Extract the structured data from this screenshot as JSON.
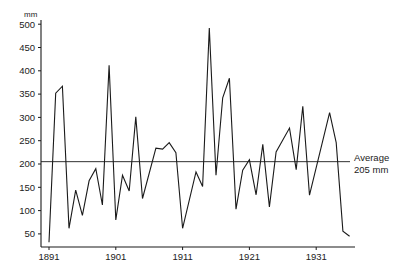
{
  "chart_data": {
    "type": "line",
    "title": "",
    "xlabel": "",
    "ylabel": "mm",
    "xlim": [
      1891,
      1936
    ],
    "ylim": [
      20,
      500
    ],
    "grid": false,
    "legend": null,
    "x_ticks": [
      1891,
      1901,
      1911,
      1921,
      1931
    ],
    "y_ticks": [
      50,
      100,
      150,
      200,
      250,
      300,
      350,
      400,
      450,
      500
    ],
    "series": [
      {
        "name": "Annual rainfall",
        "x": [
          1891,
          1892,
          1893,
          1894,
          1895,
          1896,
          1897,
          1898,
          1899,
          1900,
          1901,
          1902,
          1903,
          1904,
          1905,
          1907,
          1908,
          1909,
          1910,
          1911,
          1913,
          1914,
          1915,
          1916,
          1917,
          1918,
          1919,
          1920,
          1921,
          1922,
          1923,
          1924,
          1925,
          1927,
          1928,
          1929,
          1930,
          1933,
          1934,
          1935,
          1936
        ],
        "values": [
          32,
          352,
          367,
          62,
          144,
          90,
          164,
          190,
          112,
          412,
          80,
          176,
          142,
          301,
          126,
          234,
          232,
          246,
          224,
          62,
          183,
          152,
          492,
          176,
          342,
          384,
          103,
          187,
          209,
          134,
          242,
          108,
          226,
          277,
          188,
          324,
          133,
          310,
          246,
          56,
          45
        ]
      }
    ],
    "reference_line": {
      "value": 205,
      "label_line1": "Average",
      "label_line2": "205 mm"
    },
    "colors": {
      "line": "#1a1a1a",
      "axis": "#1a1a1a",
      "background": "#ffffff"
    }
  },
  "axis": {
    "y_unit": "mm",
    "y_tick_labels": [
      "500",
      "450",
      "400",
      "350",
      "300",
      "250",
      "200",
      "150",
      "100",
      "50"
    ],
    "x_tick_labels": [
      "1891",
      "1901",
      "1911",
      "1921",
      "1931"
    ]
  },
  "annotation": {
    "line1": "Average",
    "line2": "205 mm"
  }
}
